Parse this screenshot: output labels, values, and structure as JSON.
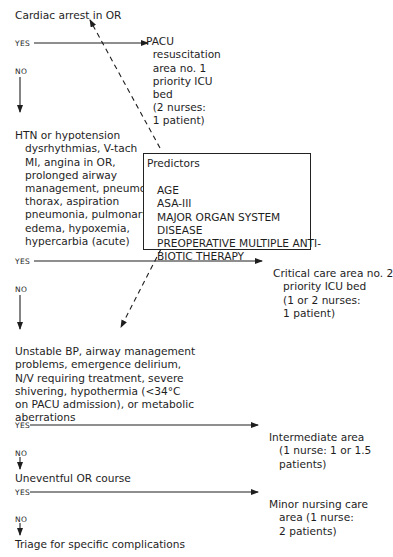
{
  "diagram": {
    "start": "Cardiac arrest in OR",
    "labels": {
      "yes": "YES",
      "no": "NO"
    },
    "decision_1": {
      "outcome_lines": [
        "PACU",
        "  resuscitation",
        "  area no. 1",
        "  priority ICU",
        "  bed",
        "  (2 nurses:",
        "  1 patient)"
      ]
    },
    "condition_2_lines": [
      "HTN or hypotension",
      "   dysrhythmias, V-tach",
      "   MI, angina in OR,",
      "   prolonged airway",
      "   management, pneumo-",
      "   thorax, aspiration",
      "   pneumonia, pulmonary",
      "   edema, hypoxemia,",
      "   hypercarbia (acute)"
    ],
    "predictors": {
      "title": "Predictors",
      "items": [
        "AGE",
        "ASA-III",
        "MAJOR ORGAN SYSTEM",
        "DISEASE",
        "PREOPERATIVE MULTIPLE ANTI-",
        "BIOTIC THERAPY"
      ]
    },
    "decision_2": {
      "outcome_lines": [
        "Critical care area no. 2",
        "   priority ICU bed",
        "   (1 or 2 nurses:",
        "   1 patient)"
      ]
    },
    "condition_3_lines": [
      "Unstable BP, airway management",
      "problems, emergence delirium,",
      "N/V requiring treatment, severe",
      "shivering, hypothermia (<34°C",
      "on PACU admission), or metabolic",
      "aberrations"
    ],
    "decision_3": {
      "outcome_lines": [
        "Intermediate area",
        "   (1 nurse: 1 or 1.5",
        "   patients)"
      ]
    },
    "condition_4": "Uneventful OR course",
    "decision_4": {
      "outcome_lines": [
        "Minor nursing care",
        "   area (1 nurse:",
        "   2 patients)"
      ]
    },
    "end": "Triage for specific complications"
  }
}
